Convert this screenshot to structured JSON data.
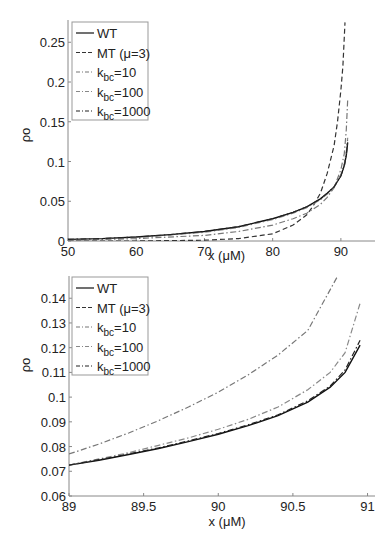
{
  "chart_data": [
    {
      "type": "line",
      "title": "",
      "xlabel": "x (μM)",
      "ylabel": "ρo",
      "xlim": [
        50,
        95
      ],
      "ylim": [
        0,
        0.278
      ],
      "xticks": [
        50,
        60,
        70,
        80,
        90
      ],
      "xtick_labels": [
        "50",
        "60",
        "70",
        "80",
        "90"
      ],
      "yticks": [
        0,
        0.05,
        0.1,
        0.15,
        0.2,
        0.25
      ],
      "ytick_labels": [
        "0",
        "0.05",
        "0.1",
        "0.15",
        "0.2",
        "0.25"
      ],
      "grid": false,
      "legend_position": "upper left",
      "series": [
        {
          "name": "WT",
          "style": "solid",
          "color": "#111111",
          "x": [
            50,
            55,
            60,
            65,
            70,
            75,
            80,
            83,
            85,
            87,
            88,
            89,
            90,
            90.5,
            90.8,
            91
          ],
          "y": [
            0.002,
            0.003,
            0.005,
            0.008,
            0.012,
            0.018,
            0.028,
            0.036,
            0.043,
            0.053,
            0.06,
            0.068,
            0.082,
            0.095,
            0.108,
            0.124
          ]
        },
        {
          "name": "MT (μ=3)",
          "style": "dashed",
          "color": "#333333",
          "x": [
            50,
            60,
            70,
            75,
            80,
            83,
            85,
            86,
            87,
            88,
            89,
            89.5,
            90,
            90.3,
            90.6
          ],
          "y": [
            0.0,
            0.0,
            0.001,
            0.003,
            0.009,
            0.02,
            0.033,
            0.045,
            0.06,
            0.085,
            0.12,
            0.15,
            0.19,
            0.22,
            0.275
          ]
        },
        {
          "name": "k_bc=10",
          "style": "dashdot",
          "color": "#777777",
          "x": [
            50,
            60,
            70,
            75,
            80,
            83,
            85,
            87,
            88,
            89,
            90,
            90.5,
            90.8,
            91
          ],
          "y": [
            0.001,
            0.003,
            0.007,
            0.012,
            0.02,
            0.028,
            0.035,
            0.046,
            0.055,
            0.067,
            0.09,
            0.11,
            0.14,
            0.178
          ]
        },
        {
          "name": "k_bc=100",
          "style": "dashdot",
          "color": "#888888",
          "x": [
            50,
            60,
            70,
            75,
            80,
            83,
            85,
            87,
            88,
            89,
            90,
            90.5,
            90.8,
            91
          ],
          "y": [
            0.002,
            0.004,
            0.011,
            0.017,
            0.027,
            0.035,
            0.042,
            0.052,
            0.059,
            0.068,
            0.083,
            0.097,
            0.112,
            0.13
          ]
        },
        {
          "name": "k_bc=1000",
          "style": "dashdot",
          "color": "#222222",
          "x": [
            50,
            55,
            60,
            65,
            70,
            75,
            80,
            83,
            85,
            87,
            88,
            89,
            90,
            90.5,
            90.8,
            91
          ],
          "y": [
            0.002,
            0.003,
            0.005,
            0.008,
            0.012,
            0.018,
            0.028,
            0.036,
            0.043,
            0.053,
            0.06,
            0.068,
            0.082,
            0.095,
            0.109,
            0.126
          ]
        }
      ]
    },
    {
      "type": "line",
      "title": "",
      "xlabel": "x (μM)",
      "ylabel": "ρo",
      "xlim": [
        89,
        91.05
      ],
      "ylim": [
        0.06,
        0.149
      ],
      "xticks": [
        89,
        89.5,
        90,
        90.5,
        91
      ],
      "xtick_labels": [
        "89",
        "89.5",
        "90",
        "90.5",
        "91"
      ],
      "yticks": [
        0.06,
        0.07,
        0.08,
        0.09,
        0.1,
        0.11,
        0.12,
        0.13,
        0.14
      ],
      "ytick_labels": [
        "0.06",
        "0.07",
        "0.08",
        "0.09",
        "0.1",
        "0.11",
        "0.12",
        "0.13",
        "0.14"
      ],
      "grid": false,
      "legend_position": "upper left",
      "series": [
        {
          "name": "WT",
          "style": "solid",
          "color": "#111111",
          "x": [
            89,
            89.2,
            89.4,
            89.6,
            89.8,
            90,
            90.2,
            90.4,
            90.6,
            90.75,
            90.85,
            90.95
          ],
          "y": [
            0.0725,
            0.0745,
            0.0768,
            0.0792,
            0.082,
            0.085,
            0.0885,
            0.0925,
            0.098,
            0.104,
            0.11,
            0.121
          ]
        },
        {
          "name": "MT (μ=3)",
          "style": "dashed",
          "color": "#333333",
          "x": [],
          "y": []
        },
        {
          "name": "k_bc=10",
          "style": "dashdot",
          "color": "#777777",
          "x": [
            89,
            89.2,
            89.4,
            89.6,
            89.8,
            90,
            90.2,
            90.4,
            90.6,
            90.8
          ],
          "y": [
            0.077,
            0.081,
            0.0855,
            0.0905,
            0.096,
            0.102,
            0.109,
            0.117,
            0.127,
            0.149
          ]
        },
        {
          "name": "k_bc=100",
          "style": "dashdot",
          "color": "#888888",
          "x": [
            89,
            89.2,
            89.4,
            89.6,
            89.8,
            90,
            90.2,
            90.4,
            90.6,
            90.75,
            90.85,
            90.95
          ],
          "y": [
            0.0725,
            0.075,
            0.0775,
            0.0805,
            0.0835,
            0.087,
            0.091,
            0.096,
            0.103,
            0.11,
            0.118,
            0.138
          ]
        },
        {
          "name": "k_bc=1000",
          "style": "dashdot",
          "color": "#222222",
          "x": [
            89,
            89.2,
            89.4,
            89.6,
            89.8,
            90,
            90.2,
            90.4,
            90.6,
            90.75,
            90.85,
            90.95
          ],
          "y": [
            0.0725,
            0.0747,
            0.077,
            0.0795,
            0.0823,
            0.0853,
            0.0888,
            0.0928,
            0.0985,
            0.1045,
            0.111,
            0.123
          ]
        }
      ]
    }
  ],
  "legend": {
    "items": [
      {
        "main": "WT",
        "sub": "",
        "suffix": ""
      },
      {
        "main": "MT (μ=3)",
        "sub": "",
        "suffix": ""
      },
      {
        "main": "k",
        "sub": "bc",
        "suffix": "=10"
      },
      {
        "main": "k",
        "sub": "bc",
        "suffix": "=100"
      },
      {
        "main": "k",
        "sub": "bc",
        "suffix": "=1000"
      }
    ]
  }
}
